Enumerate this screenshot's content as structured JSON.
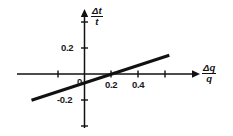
{
  "chart_data": {
    "type": "line",
    "title": "",
    "xlabel": "Δq/q",
    "ylabel": "Δt/t",
    "xlabel_numerator": "Δq",
    "xlabel_denominator": "q",
    "ylabel_numerator": "Δt",
    "ylabel_denominator": "t",
    "xlim": [
      -0.42,
      0.68
    ],
    "ylim": [
      -0.3,
      0.3
    ],
    "x_ticks": [
      -0.2,
      0,
      0.2,
      0.4,
      0.6
    ],
    "x_tick_labels": [
      "",
      "0",
      "0.2",
      "0.4",
      ""
    ],
    "y_ticks": [
      -0.2,
      0,
      0.2
    ],
    "y_tick_labels": [
      "-0.2",
      "",
      "0.2"
    ],
    "grid": false,
    "legend": false,
    "series": [
      {
        "name": "measured line",
        "slope": 0.333,
        "intercept": -0.069,
        "x": [
          -0.4,
          0.64
        ],
        "values": [
          -0.202,
          0.144
        ],
        "color": "#111111"
      }
    ],
    "x_zero_crossing": 0.21,
    "axis_color": "#111111",
    "background": "#ffffff"
  },
  "ticks": {
    "y_positive": "0.2",
    "y_negative": "-0.2",
    "origin": "0",
    "x_first": "0.2",
    "x_second": "0.4"
  }
}
